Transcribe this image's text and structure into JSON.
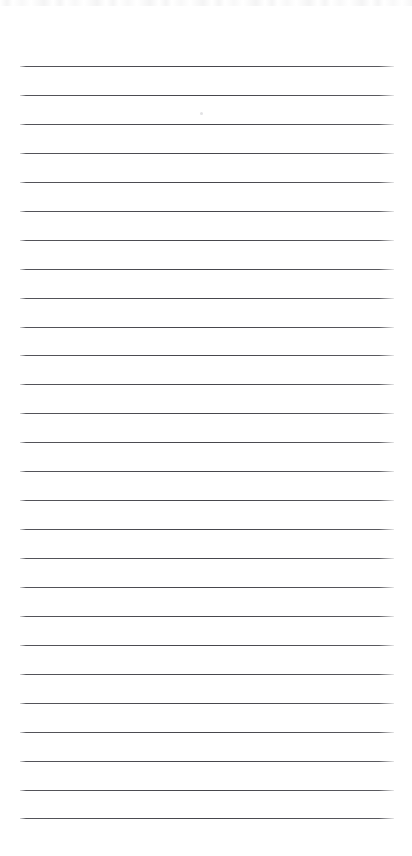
{
  "page": {
    "kind": "blank-ruled-notepad-sheet",
    "width": 412,
    "height": 856,
    "background_color": "#ffffff",
    "text_content": "",
    "has_handwriting": false,
    "has_printed_text": false
  },
  "ruling": {
    "line_color": "#3e3e44",
    "line_count": 27,
    "line_thickness_px": 1,
    "line_spacing_px": 29,
    "first_line_y": 66,
    "last_line_y": 818,
    "line_start_x": 20,
    "line_end_x": 394,
    "line_length_px": 374,
    "left_margin_px": 20,
    "right_margin_px": 18,
    "top_margin_px": 66,
    "bottom_margin_px": 38,
    "has_vertical_margin_rule": false,
    "line_y_positions": [
      66,
      95,
      124,
      153,
      182,
      211,
      240,
      269,
      298,
      327,
      355,
      384,
      413,
      442,
      471,
      500,
      529,
      558,
      587,
      616,
      645,
      674,
      703,
      732,
      761,
      790,
      818
    ]
  },
  "artifacts": {
    "scan_noise_band": {
      "present": true,
      "x": 0,
      "y": 0,
      "width": 412,
      "height": 6
    },
    "speck": {
      "present": true,
      "x": 200,
      "y": 112,
      "color": "#a0a0a6"
    }
  }
}
